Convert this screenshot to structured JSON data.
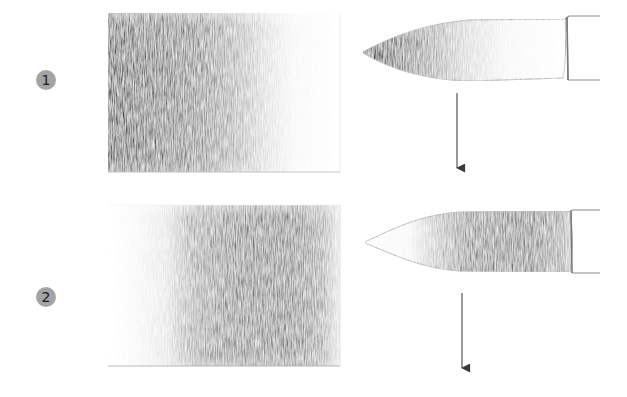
{
  "illustration": {
    "background": "#ffffff",
    "badge_color": "#a4a4a4",
    "steps": [
      {
        "number": "1",
        "swatch": {
          "description": "pencil shading swatch, dark on left fading to white on right",
          "dark_side": "left"
        },
        "brush": {
          "description": "round brush, tip dark, fading toward ferrule",
          "shading": "tip"
        },
        "arrow": "down-arrow"
      },
      {
        "number": "2",
        "swatch": {
          "description": "pencil shading swatch, light on left, dark band toward right",
          "dark_side": "right"
        },
        "brush": {
          "description": "round brush, tip light, dark near ferrule",
          "shading": "base"
        },
        "arrow": "down-arrow"
      }
    ]
  }
}
